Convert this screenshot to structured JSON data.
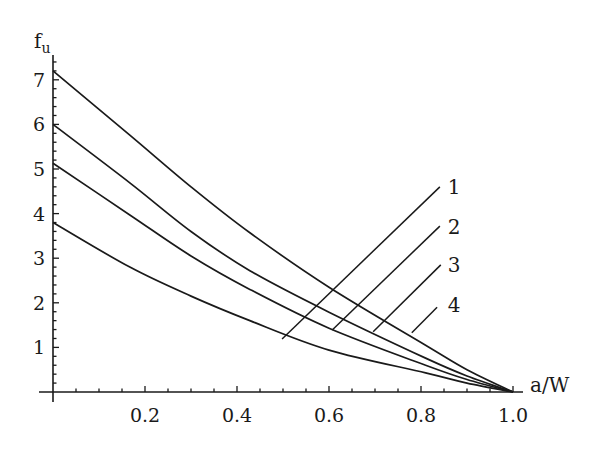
{
  "chart_data": {
    "type": "line",
    "title": "",
    "xlabel": "a/W",
    "ylabel": "f",
    "ylabel_subscript": "u",
    "xlim": [
      0,
      1.0
    ],
    "ylim": [
      0,
      7.5
    ],
    "grid": false,
    "legend": "inline numeric labels with leader lines",
    "x_ticks": [
      0.2,
      0.4,
      0.6,
      0.8,
      1.0
    ],
    "x_tick_labels": [
      "0.2",
      "0.4",
      "0.6",
      "0.8",
      "1.0"
    ],
    "x_minor_step": 0.05,
    "y_ticks": [
      1,
      2,
      3,
      4,
      5,
      6,
      7
    ],
    "y_tick_labels": [
      "1",
      "2",
      "3",
      "4",
      "5",
      "6",
      "7"
    ],
    "y_minor_step": 0.2,
    "series": [
      {
        "name": "1",
        "x": [
          0,
          0.167,
          0.3,
          0.428,
          0.6,
          0.81,
          0.9,
          1.0
        ],
        "values": [
          7.2,
          5.76,
          4.6,
          3.57,
          2.35,
          1.05,
          0.5,
          0
        ]
      },
      {
        "name": "2",
        "x": [
          0,
          0.167,
          0.3,
          0.428,
          0.6,
          0.81,
          0.9,
          1.0
        ],
        "values": [
          6.0,
          4.69,
          3.6,
          2.72,
          1.79,
          0.76,
          0.36,
          0
        ]
      },
      {
        "name": "3",
        "x": [
          0,
          0.167,
          0.3,
          0.428,
          0.6,
          0.81,
          0.9,
          1.0
        ],
        "values": [
          5.13,
          3.97,
          3.05,
          2.3,
          1.43,
          0.6,
          0.28,
          0
        ]
      },
      {
        "name": "4",
        "x": [
          0,
          0.167,
          0.3,
          0.428,
          0.6,
          0.81,
          0.9,
          1.0
        ],
        "values": [
          3.8,
          2.8,
          2.15,
          1.6,
          0.94,
          0.43,
          0.2,
          0
        ]
      }
    ],
    "annotations": [
      {
        "text": "1",
        "line_from": [
          0.498,
          1.19
        ],
        "line_to": [
          0.841,
          4.6
        ],
        "label_at": [
          0.858,
          4.45
        ]
      },
      {
        "text": "2",
        "line_from": [
          0.607,
          1.39
        ],
        "line_to": [
          0.841,
          3.72
        ],
        "label_at": [
          0.858,
          3.55
        ]
      },
      {
        "text": "3",
        "line_from": [
          0.696,
          1.35
        ],
        "line_to": [
          0.843,
          2.85
        ],
        "label_at": [
          0.858,
          2.68
        ]
      },
      {
        "text": "4",
        "line_from": [
          0.78,
          1.33
        ],
        "line_to": [
          0.835,
          1.9
        ],
        "label_at": [
          0.858,
          1.8
        ]
      }
    ]
  },
  "layout": {
    "origin_px": [
      53,
      392
    ],
    "px_per_x": 460,
    "px_per_y": 44.6,
    "x_axis_end_px": 523,
    "y_axis_top_px": 55
  }
}
